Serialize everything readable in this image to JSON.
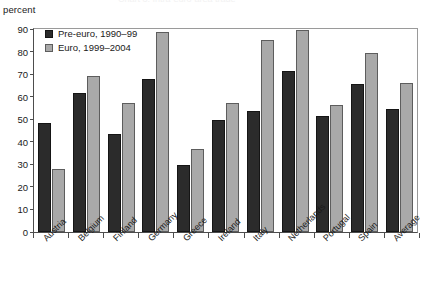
{
  "figure": {
    "unit_label": "percent",
    "cropped_title": "Chart 3. Intra-euro-area trade",
    "colors": {
      "pre_euro_bar": "#2b2b2b",
      "euro_bar": "#a9a9a9",
      "axis": "#4d4d4d",
      "frame": "#9a9a9a",
      "background": "#ffffff",
      "text": "#1a1a1a"
    }
  },
  "legend": {
    "position": "top-left-inside",
    "entries": [
      {
        "label": "Pre-euro, 1990–99",
        "swatch": "pre"
      },
      {
        "label": "Euro, 1999–2004",
        "swatch": "euro"
      }
    ]
  },
  "axes": {
    "y_ticks": [
      "90",
      "80",
      "70",
      "60",
      "50",
      "40",
      "30",
      "20",
      "10",
      "0"
    ],
    "x_categories": [
      "Austria",
      "Belgium",
      "Finland",
      "Germany",
      "Greece",
      "Ireland",
      "Italy",
      "Netherlands",
      "Portugal",
      "Spain",
      "Average"
    ]
  },
  "chart_data": {
    "type": "bar",
    "title": "",
    "xlabel": "",
    "ylabel": "percent",
    "ylim": [
      0,
      90
    ],
    "ytick_step": 10,
    "grid": false,
    "legend_position": "upper left (inside plot)",
    "categories": [
      "Austria",
      "Belgium",
      "Finland",
      "Germany",
      "Greece",
      "Ireland",
      "Italy",
      "Netherlands",
      "Portugal",
      "Spain",
      "Average"
    ],
    "series": [
      {
        "name": "Pre-euro, 1990–99",
        "color": "#2b2b2b",
        "values": [
          48.5,
          61.5,
          43.5,
          68.0,
          29.5,
          49.5,
          53.5,
          71.5,
          51.5,
          65.5,
          54.5
        ]
      },
      {
        "name": "Euro, 1999–2004",
        "color": "#a9a9a9",
        "values": [
          28.0,
          69.0,
          57.0,
          88.5,
          37.0,
          57.0,
          85.0,
          89.5,
          56.5,
          79.5,
          66.0
        ]
      }
    ]
  }
}
